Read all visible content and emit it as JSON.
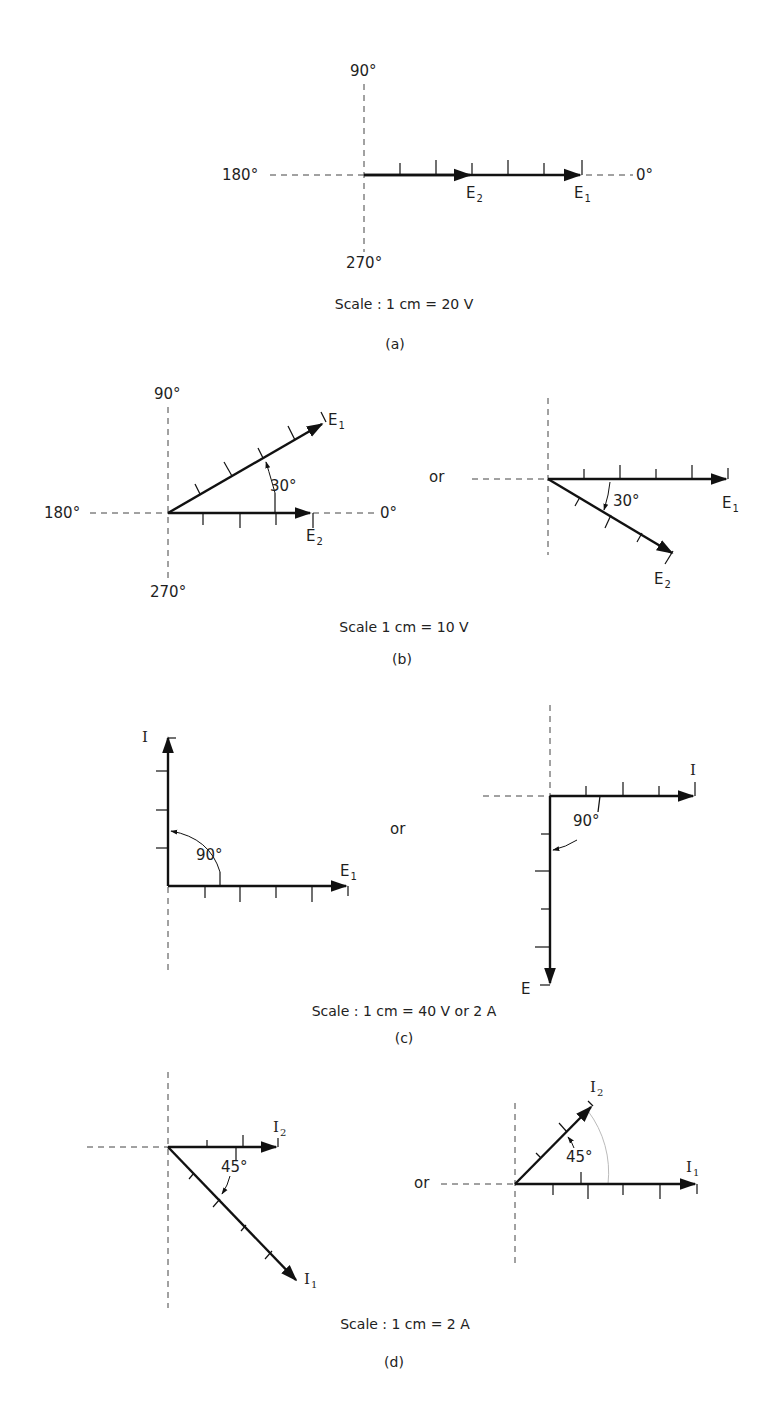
{
  "figure": {
    "panels": [
      {
        "id": "a",
        "tag": "(a)",
        "scale": "Scale : 1 cm = 20 V",
        "axis_labels": {
          "up": "90°",
          "left": "180°",
          "right": "0°",
          "down": "270°"
        },
        "phasors": [
          {
            "name": "E",
            "sub": "2",
            "angle_deg": 0,
            "length_cm": 4
          },
          {
            "name": "E",
            "sub": "1",
            "angle_deg": 0,
            "length_cm": 7
          }
        ]
      },
      {
        "id": "b",
        "tag": "(b)",
        "scale": "Scale 1 cm = 10 V",
        "connector": "or",
        "left": {
          "axis_labels": {
            "up": "90°",
            "left": "180°",
            "right": "0°",
            "down": "270°"
          },
          "angle_label": "30°",
          "phasors": [
            {
              "name": "E",
              "sub": "1",
              "angle_deg": 30,
              "length_cm": 5
            },
            {
              "name": "E",
              "sub": "2",
              "angle_deg": 0,
              "length_cm": 4
            }
          ]
        },
        "right": {
          "angle_label": "30°",
          "phasors": [
            {
              "name": "E",
              "sub": "1",
              "angle_deg": 0,
              "length_cm": 5
            },
            {
              "name": "E",
              "sub": "2",
              "angle_deg": -30,
              "length_cm": 4
            }
          ]
        }
      },
      {
        "id": "c",
        "tag": "(c)",
        "scale": "Scale : 1 cm = 40 V or 2 A",
        "connector": "or",
        "left": {
          "angle_label": "90°",
          "phasors": [
            {
              "name": "I",
              "sub": "",
              "angle_deg": 90,
              "length_cm": 4
            },
            {
              "name": "E",
              "sub": "1",
              "angle_deg": 0,
              "length_cm": 5
            }
          ]
        },
        "right": {
          "angle_label": "90°",
          "phasors": [
            {
              "name": "I",
              "sub": "",
              "angle_deg": 0,
              "length_cm": 4
            },
            {
              "name": "E",
              "sub": "",
              "angle_deg": -90,
              "length_cm": 5
            }
          ]
        }
      },
      {
        "id": "d",
        "tag": "(d)",
        "scale": "Scale : 1 cm = 2 A",
        "connector": "or",
        "left": {
          "angle_label": "45°",
          "phasors": [
            {
              "name": "I",
              "sub": "2",
              "angle_deg": 0,
              "length_cm": 3
            },
            {
              "name": "I",
              "sub": "1",
              "angle_deg": -45,
              "length_cm": 5
            }
          ]
        },
        "right": {
          "angle_label": "45°",
          "phasors": [
            {
              "name": "I",
              "sub": "2",
              "angle_deg": 45,
              "length_cm": 3
            },
            {
              "name": "I",
              "sub": "1",
              "angle_deg": 0,
              "length_cm": 5
            }
          ]
        }
      }
    ]
  },
  "colors": {
    "ink": "#1a1a1a",
    "axis": "#444444",
    "background": "#ffffff"
  }
}
